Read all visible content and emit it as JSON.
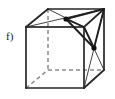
{
  "figure": {
    "label": "f)",
    "caption_text": "f)",
    "type": "cube-with-face-center-points",
    "background_color": "#ffffff",
    "edge_color": "#262626",
    "hidden_edge_color": "#8c8c8c",
    "diagonal_color": "#1f1f1f",
    "dot_color": "#111111",
    "canvas": {
      "width": 115,
      "height": 99
    },
    "vertices": {
      "front_top_left": {
        "x": 26,
        "y": 27
      },
      "front_top_right": {
        "x": 84,
        "y": 27
      },
      "front_bottom_left": {
        "x": 26,
        "y": 88
      },
      "front_bottom_right": {
        "x": 84,
        "y": 88
      },
      "back_top_left": {
        "x": 48,
        "y": 9
      },
      "back_top_right": {
        "x": 104,
        "y": 9
      },
      "back_bottom_left": {
        "x": 48,
        "y": 70
      },
      "back_bottom_right": {
        "x": 104,
        "y": 70
      }
    },
    "marked_points": [
      {
        "name": "top-face-center",
        "x": 66,
        "y": 19,
        "face": "top",
        "radius": 2.6
      },
      {
        "name": "right-face-center",
        "x": 94,
        "y": 48,
        "face": "right",
        "radius": 2.6
      }
    ],
    "solid_edges": [
      {
        "name": "front-top",
        "from": "front_top_left",
        "to": "front_top_right"
      },
      {
        "name": "front-right",
        "from": "front_top_right",
        "to": "front_bottom_right"
      },
      {
        "name": "front-bottom",
        "from": "front_bottom_right",
        "to": "front_bottom_left"
      },
      {
        "name": "front-left",
        "from": "front_bottom_left",
        "to": "front_top_left"
      },
      {
        "name": "back-top",
        "from": "back_top_left",
        "to": "back_top_right"
      },
      {
        "name": "back-right",
        "from": "back_top_right",
        "to": "back_bottom_right"
      },
      {
        "name": "top-left-depth",
        "from": "front_top_left",
        "to": "back_top_left"
      },
      {
        "name": "top-right-depth",
        "from": "front_top_right",
        "to": "back_top_right"
      },
      {
        "name": "bottom-right-depth",
        "from": "front_bottom_right",
        "to": "back_bottom_right"
      }
    ],
    "hidden_edges": [
      {
        "name": "back-left-vertical",
        "from": "back_top_left",
        "to": "back_bottom_left"
      },
      {
        "name": "back-bottom",
        "from": "back_bottom_left",
        "to": "back_bottom_right"
      },
      {
        "name": "bottom-left-depth",
        "from": "front_bottom_left",
        "to": "back_bottom_left"
      }
    ],
    "top_face_diagonals": [
      {
        "name": "top-diag-ftl-btr",
        "from": "front_top_left",
        "to": "back_top_right",
        "weight": "thin"
      },
      {
        "name": "top-diag-btl-ftr",
        "from": "back_top_left",
        "to": "front_top_right",
        "weight": "thin"
      },
      {
        "name": "top-center-to-ftr",
        "from": "top-face-center",
        "to": "front_top_right",
        "weight": "bold"
      },
      {
        "name": "top-center-to-btr",
        "from": "top-face-center",
        "to": "back_top_right",
        "weight": "bold"
      }
    ],
    "right_face_diagonals": [
      {
        "name": "right-diag-ftr-bbr",
        "from": "front_top_right",
        "to": "back_bottom_right",
        "weight": "thin"
      },
      {
        "name": "right-diag-btr-fbr",
        "from": "back_top_right",
        "to": "front_bottom_right",
        "weight": "thin"
      },
      {
        "name": "right-center-to-ftr",
        "from": "right-face-center",
        "to": "front_top_right",
        "weight": "bold"
      },
      {
        "name": "right-center-to-btr",
        "from": "right-face-center",
        "to": "back_top_right",
        "weight": "bold"
      }
    ],
    "connector_edges": [
      {
        "name": "top-center-to-right-center",
        "from": "top-face-center",
        "to": "right-face-center",
        "weight": "bold"
      }
    ]
  }
}
